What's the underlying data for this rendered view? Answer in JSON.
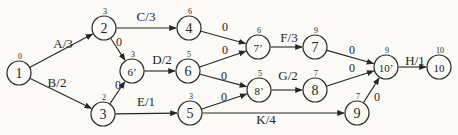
{
  "figure": {
    "type": "activity-network-diagram",
    "canvas": {
      "width": 458,
      "height": 135
    },
    "colors": {
      "paper": "#fbfaf7",
      "ink": "#262626"
    },
    "node_radius": 12,
    "nodes": [
      {
        "id": "n1",
        "label": "1",
        "sup": "0",
        "x": 19,
        "y": 73
      },
      {
        "id": "n2",
        "label": "2",
        "sup": "3",
        "x": 104,
        "y": 28
      },
      {
        "id": "n3",
        "label": "3",
        "sup": "2",
        "x": 103,
        "y": 114
      },
      {
        "id": "n4",
        "label": "4",
        "sup": "6",
        "x": 189,
        "y": 28
      },
      {
        "id": "n6p",
        "label": "6’",
        "sup": "3",
        "x": 132,
        "y": 71
      },
      {
        "id": "n6",
        "label": "6",
        "sup": "5",
        "x": 188,
        "y": 71
      },
      {
        "id": "n5",
        "label": "5",
        "sup": "3",
        "x": 190,
        "y": 113
      },
      {
        "id": "n7p",
        "label": "7’",
        "sup": "6",
        "x": 258,
        "y": 47
      },
      {
        "id": "n7",
        "label": "7",
        "sup": "9",
        "x": 315,
        "y": 47
      },
      {
        "id": "n8p",
        "label": "8’",
        "sup": "5",
        "x": 259,
        "y": 90
      },
      {
        "id": "n8",
        "label": "8",
        "sup": "7",
        "x": 315,
        "y": 90
      },
      {
        "id": "n9",
        "label": "9",
        "sup": "7",
        "x": 357,
        "y": 113
      },
      {
        "id": "n10p",
        "label": "10’",
        "sup": "9",
        "x": 386,
        "y": 67
      },
      {
        "id": "n10",
        "label": "10",
        "sup": "10",
        "x": 439,
        "y": 67
      }
    ],
    "edges": [
      {
        "from": "n1",
        "to": "n2",
        "label": "A/3",
        "lx": 63,
        "ly": 43
      },
      {
        "from": "n1",
        "to": "n3",
        "label": "B/2",
        "lx": 57,
        "ly": 82
      },
      {
        "from": "n2",
        "to": "n4",
        "label": "C/3",
        "lx": 146,
        "ly": 16
      },
      {
        "from": "n2",
        "to": "n6p",
        "label": "0",
        "lx": 119,
        "ly": 42
      },
      {
        "from": "n3",
        "to": "n6p",
        "label": "0",
        "lx": 118,
        "ly": 85
      },
      {
        "from": "n3",
        "to": "n5",
        "label": "E/1",
        "lx": 146,
        "ly": 101
      },
      {
        "from": "n6p",
        "to": "n6",
        "label": "D/2",
        "lx": 162,
        "ly": 59
      },
      {
        "from": "n4",
        "to": "n7p",
        "label": "0",
        "lx": 225,
        "ly": 27
      },
      {
        "from": "n6",
        "to": "n7p",
        "label": "0",
        "lx": 225,
        "ly": 50
      },
      {
        "from": "n6",
        "to": "n8p",
        "label": "0",
        "lx": 224,
        "ly": 76
      },
      {
        "from": "n5",
        "to": "n8p",
        "label": "0",
        "lx": 224,
        "ly": 97
      },
      {
        "from": "n7p",
        "to": "n7",
        "label": "F/3",
        "lx": 289,
        "ly": 37
      },
      {
        "from": "n8p",
        "to": "n8",
        "label": "G/2",
        "lx": 288,
        "ly": 75
      },
      {
        "from": "n5",
        "to": "n9",
        "label": "K/4",
        "lx": 266,
        "ly": 119
      },
      {
        "from": "n7",
        "to": "n10p",
        "label": "0",
        "lx": 352,
        "ly": 50
      },
      {
        "from": "n8",
        "to": "n10p",
        "label": "0",
        "lx": 352,
        "ly": 68
      },
      {
        "from": "n9",
        "to": "n10p",
        "label": "0",
        "lx": 377,
        "ly": 97
      },
      {
        "from": "n10p",
        "to": "n10",
        "label": "H/1",
        "lx": 415,
        "ly": 60
      }
    ]
  }
}
